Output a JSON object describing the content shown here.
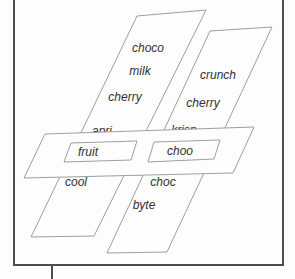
{
  "diagram": {
    "colors": {
      "background": "#fdfdfd",
      "shape_line": "#9e9e9e",
      "frame_line": "#4d4d4d",
      "text": "#303030"
    },
    "left_column": {
      "labels": [
        "choco",
        "milk",
        "cherry",
        "apri",
        "cool"
      ]
    },
    "right_column": {
      "labels": [
        "crunch",
        "cherry",
        "krisp",
        "choc",
        "byte"
      ]
    },
    "band": {
      "box_labels": [
        "fruit",
        "choo"
      ]
    }
  }
}
